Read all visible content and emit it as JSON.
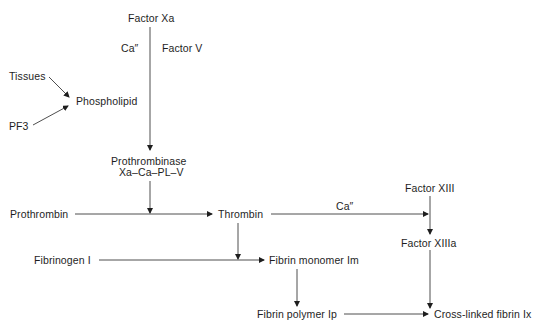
{
  "diagram": {
    "type": "flowchart",
    "title": "",
    "nodes": {
      "factor_xa": "Factor Xa",
      "ca_1": "Ca″",
      "factor_v": "Factor  V",
      "tissues": "Tissues",
      "phospholipid": "Phospholipid",
      "pf3": "PF3",
      "prothrombinase": "Prothrombinase",
      "prothrombinase_complex": "Xa–Ca–PL–V",
      "prothrombin": "Prothrombin",
      "thrombin": "Thrombin",
      "ca_2": "Ca″",
      "factor_xiii": "Factor XIII",
      "factor_xiiia": "Factor XIIIa",
      "fibrinogen": "Fibrinogen I",
      "fibrin_monomer": "Fibrin monomer Im",
      "fibrin_polymer": "Fibrin polymer Ip",
      "cross_linked_fibrin": "Cross-linked fibrin Ix"
    },
    "edges": [
      {
        "from": "Factor Xa",
        "to": "Prothrombinase",
        "annotations": [
          "Ca″",
          "Factor V"
        ]
      },
      {
        "from": "Tissues",
        "to": "Phospholipid"
      },
      {
        "from": "PF3",
        "to": "Phospholipid"
      },
      {
        "from": "Prothrombinase",
        "to": "Prothrombin→Thrombin"
      },
      {
        "from": "Prothrombin",
        "to": "Thrombin"
      },
      {
        "from": "Thrombin",
        "to": "Factor XIII→Factor XIIIa",
        "annotations": [
          "Ca″"
        ]
      },
      {
        "from": "Factor XIII",
        "to": "Factor XIIIa"
      },
      {
        "from": "Thrombin",
        "to": "Fibrinogen I→Fibrin monomer Im"
      },
      {
        "from": "Fibrinogen I",
        "to": "Fibrin monomer Im"
      },
      {
        "from": "Fibrin monomer Im",
        "to": "Fibrin polymer Ip"
      },
      {
        "from": "Fibrin polymer Ip",
        "to": "Cross-linked fibrin Ix"
      },
      {
        "from": "Factor XIIIa",
        "to": "Cross-linked fibrin Ix"
      }
    ]
  }
}
